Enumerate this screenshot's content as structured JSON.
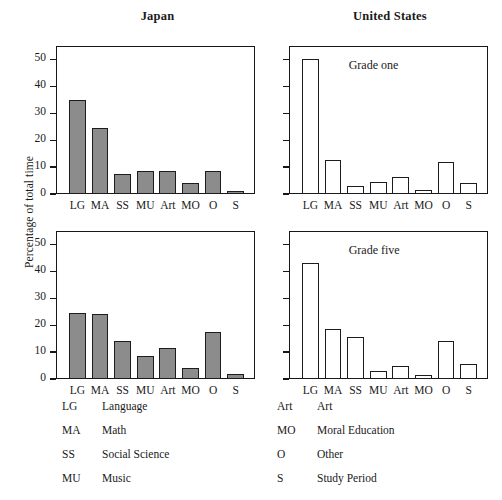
{
  "figure": {
    "column_titles": {
      "left": "Japan",
      "right": "United States"
    },
    "y_axis_label": "Percentage of total time",
    "panel_notes": {
      "top_right": "Grade one",
      "bottom_right": "Grade five"
    },
    "colors": {
      "japan_bar_fill": "#8c8c8c",
      "us_bar_fill": "#ffffff",
      "bar_outline": "#1c1c1c",
      "axis": "#171717",
      "background": "#ffffff"
    }
  },
  "legend": {
    "left_column": [
      {
        "abbr": "LG",
        "name": "Language"
      },
      {
        "abbr": "MA",
        "name": "Math"
      },
      {
        "abbr": "SS",
        "name": "Social Science"
      },
      {
        "abbr": "MU",
        "name": "Music"
      }
    ],
    "right_column": [
      {
        "abbr": "Art",
        "name": "Art"
      },
      {
        "abbr": "MO",
        "name": "Moral Education"
      },
      {
        "abbr": "O",
        "name": "Other"
      },
      {
        "abbr": "S",
        "name": "Study Period"
      }
    ]
  },
  "chart_data": [
    {
      "type": "bar",
      "title": "Japan",
      "subtitle": "Grade one",
      "country": "Japan",
      "grade": "Grade one",
      "xlabel": "",
      "ylabel": "Percentage of total time",
      "categories": [
        "LG",
        "MA",
        "SS",
        "MU",
        "Art",
        "MO",
        "O",
        "S"
      ],
      "values": [
        35,
        24.5,
        7.5,
        8.7,
        8.7,
        4,
        8.7,
        1
      ],
      "ylim": [
        0,
        55
      ],
      "yticks": [
        0,
        10,
        20,
        30,
        40,
        50
      ],
      "ytick_labels": [
        "0",
        "10",
        "20",
        "30",
        "40",
        "50"
      ],
      "grid": false,
      "legend": "none",
      "bar_fill": "#8c8c8c"
    },
    {
      "type": "bar",
      "title": "United States",
      "subtitle": "Grade one",
      "country": "United States",
      "grade": "Grade one",
      "xlabel": "",
      "ylabel": "",
      "categories": [
        "LG",
        "MA",
        "SS",
        "MU",
        "Art",
        "MO",
        "O",
        "S"
      ],
      "values": [
        50,
        12.5,
        3,
        4.5,
        6.5,
        1.5,
        12,
        4
      ],
      "ylim": [
        0,
        55
      ],
      "yticks": [
        0,
        10,
        20,
        30,
        40,
        50
      ],
      "ytick_labels": [
        "",
        "",
        "",
        "",
        "",
        ""
      ],
      "grid": false,
      "legend": "none",
      "bar_fill": "#ffffff"
    },
    {
      "type": "bar",
      "title": "Japan",
      "subtitle": "Grade five",
      "country": "Japan",
      "grade": "Grade five",
      "xlabel": "",
      "ylabel": "Percentage of total time",
      "categories": [
        "LG",
        "MA",
        "SS",
        "MU",
        "Art",
        "MO",
        "O",
        "S"
      ],
      "values": [
        24.5,
        24.3,
        14,
        8.5,
        11.5,
        4,
        17.5,
        2
      ],
      "ylim": [
        0,
        55
      ],
      "yticks": [
        0,
        10,
        20,
        30,
        40,
        50
      ],
      "ytick_labels": [
        "0",
        "10",
        "20",
        "30",
        "40",
        "50"
      ],
      "grid": false,
      "legend": "none",
      "bar_fill": "#8c8c8c"
    },
    {
      "type": "bar",
      "title": "United States",
      "subtitle": "Grade five",
      "country": "United States",
      "grade": "Grade five",
      "xlabel": "",
      "ylabel": "",
      "categories": [
        "LG",
        "MA",
        "SS",
        "MU",
        "Art",
        "MO",
        "O",
        "S"
      ],
      "values": [
        43,
        18.5,
        15.5,
        3,
        5,
        1.5,
        14,
        5.5
      ],
      "ylim": [
        0,
        55
      ],
      "yticks": [
        0,
        10,
        20,
        30,
        40,
        50
      ],
      "ytick_labels": [
        "",
        "",
        "",
        "",
        "",
        ""
      ],
      "grid": false,
      "legend": "none",
      "bar_fill": "#ffffff"
    }
  ]
}
